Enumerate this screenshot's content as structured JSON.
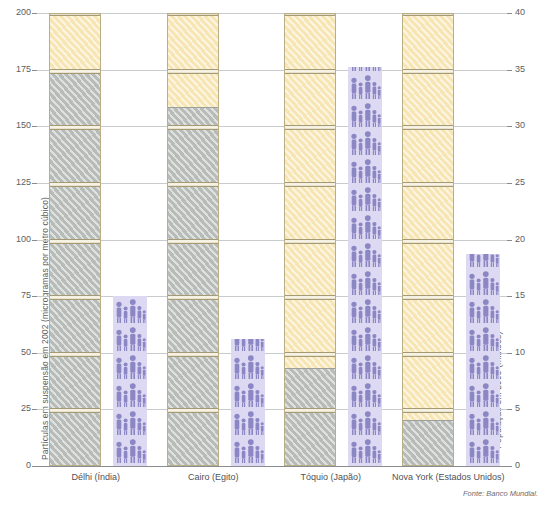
{
  "chart_data": {
    "type": "bar",
    "title": "",
    "subtitle": "",
    "source": "Fonte: Banco Mundial.",
    "categories": [
      "Délhi (Índia)",
      "Cairo (Egito)",
      "Tóquio (Japão)",
      "Nova York (Estados Unidos)"
    ],
    "left_axis": {
      "label": "Partículas em suspensão em 2002 (microgramas por metro cúbico)",
      "ticks": [
        0,
        25,
        50,
        75,
        100,
        125,
        150,
        175,
        200
      ],
      "ylim": [
        0,
        200
      ],
      "unit": "microgramas por metro cúbico"
    },
    "right_axis": {
      "label": "População em 2005 (milhões)",
      "ticks": [
        0,
        5,
        10,
        15,
        20,
        25,
        30,
        35,
        40
      ],
      "ylim": [
        0,
        40
      ],
      "unit": "milhões"
    },
    "grid": true,
    "legend": null,
    "series": [
      {
        "name": "Partículas em suspensão em 2002",
        "axis": "left",
        "unit": "microgramas por metro cúbico",
        "style": "smokestack",
        "values": [
          200,
          200,
          200,
          200
        ],
        "measured_values": [
          175,
          158,
          43,
          20
        ],
        "note": "Altura cinza indica o valor medido; topo creme completa a chaminé até 200."
      },
      {
        "name": "População em 2005",
        "axis": "right",
        "unit": "milhões",
        "style": "pictogram-people",
        "values": [
          15.0,
          11.2,
          35.2,
          18.7
        ]
      }
    ],
    "colors": {
      "pollution_measured": "#b7bcb9",
      "pollution_stack": "#f7e6b4",
      "stack_outline": "#b9ae86",
      "population_fill": "#ddd9f2",
      "population_icon": "#8b86c4",
      "gridline": "#c9ccce",
      "axis_text": "#5b5e62",
      "background": "#ffffff"
    }
  }
}
